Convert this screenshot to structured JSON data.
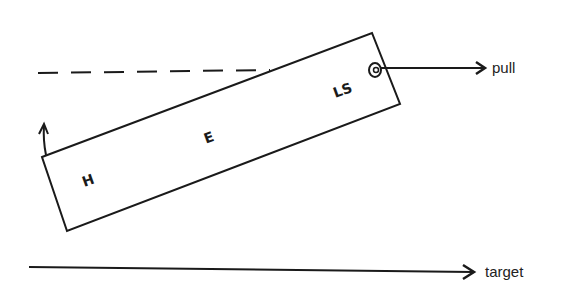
{
  "diagram": {
    "labels": {
      "head": "H",
      "eye": "E",
      "lateral_side": "LS",
      "pull": "pull",
      "target": "target"
    },
    "colors": {
      "stroke": "#1a1a1a",
      "background": "#ffffff"
    }
  }
}
